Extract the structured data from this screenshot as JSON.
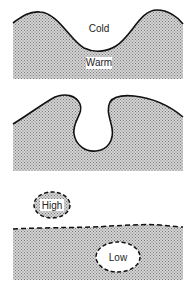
{
  "diagram": {
    "type": "interface-instability-stages",
    "colors": {
      "fill_stipple": "#bdbdbd",
      "stipple_dot": "#8a8a8a",
      "line": "#111111",
      "background": "#ffffff"
    },
    "panels": [
      {
        "id": "panel-1",
        "description": "Wavy interface between cold (top) and warm (bottom) fluid",
        "labels": {
          "upper": "Cold",
          "lower": "Warm"
        }
      },
      {
        "id": "panel-2",
        "description": "Overturning interface forming a mushroom-shaped intrusion"
      },
      {
        "id": "panel-3",
        "description": "Detached blobs with dashed boundaries",
        "labels": {
          "blob_above": "High",
          "blob_below": "Low"
        }
      }
    ]
  }
}
